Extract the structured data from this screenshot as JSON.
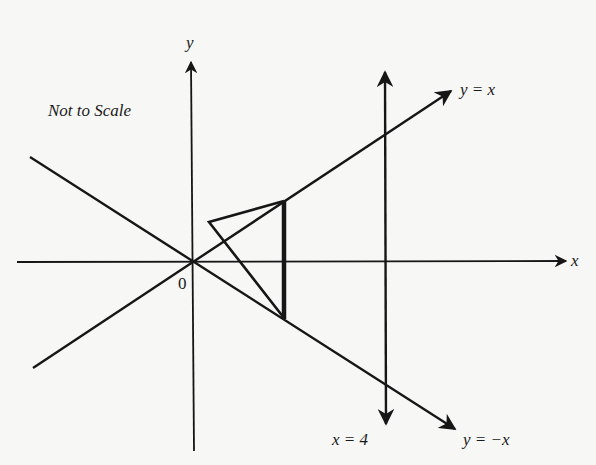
{
  "diagram": {
    "note": "Not to Scale",
    "axes": {
      "x_label": "x",
      "y_label": "y",
      "origin_label": "0"
    },
    "lines": [
      {
        "id": "line-y-equals-x",
        "label": "y = x"
      },
      {
        "id": "line-y-equals-neg-x",
        "label": "y = −x"
      },
      {
        "id": "line-x-equals-4",
        "label": "x = 4"
      }
    ],
    "shapes": [
      {
        "id": "triangle",
        "description": "triangle with vertical side on y=x / y=-x, bold vertical edge"
      }
    ],
    "colors": {
      "ink": "#161616",
      "paper": "#f7f7f5"
    }
  }
}
